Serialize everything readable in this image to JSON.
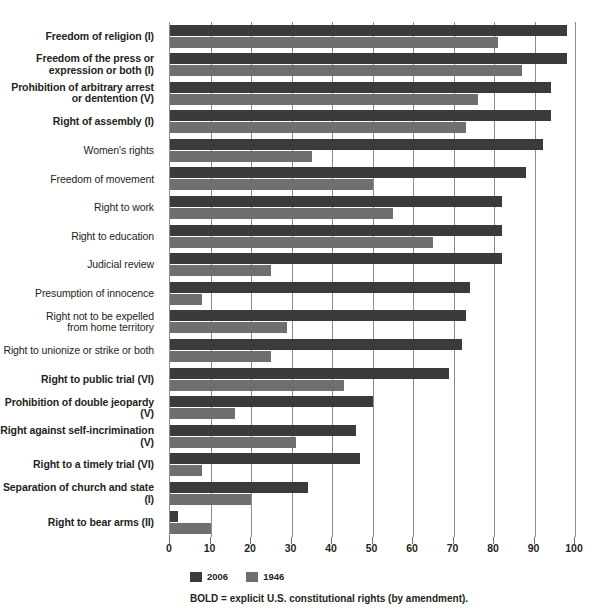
{
  "chart_data": {
    "type": "bar",
    "orientation": "horizontal",
    "title": "",
    "xlabel": "",
    "ylabel": "",
    "xlim": [
      0,
      100
    ],
    "xticks": [
      0,
      10,
      20,
      30,
      40,
      50,
      60,
      70,
      80,
      90,
      100
    ],
    "grid": true,
    "legend_position": "bottom-left",
    "categories": [
      "Freedom of religion (I)",
      "Freedom of the press or expression or both (I)",
      "Prohibition of arbitrary arrest or dentention (V)",
      "Right of assembly (I)",
      "Women's rights",
      "Freedom of movement",
      "Right to work",
      "Right to education",
      "Judicial review",
      "Presumption of innocence",
      "Right not to be expelled from home territory",
      "Right to unionize or strike or both",
      "Right to public trial (VI)",
      "Prohibition of double jeopardy (V)",
      "Right against self-incrimination (V)",
      "Right to a timely trial (VI)",
      "Separation of church and state (I)",
      "Right to bear arms (II)"
    ],
    "series": [
      {
        "name": "2006",
        "color": "#3b3b3b",
        "values": [
          98,
          98,
          94,
          94,
          92,
          88,
          82,
          82,
          82,
          74,
          73,
          72,
          69,
          50,
          46,
          47,
          34,
          2
        ]
      },
      {
        "name": "1946",
        "color": "#6f6f6f",
        "values": [
          81,
          87,
          76,
          73,
          35,
          50,
          55,
          65,
          25,
          8,
          29,
          25,
          43,
          16,
          31,
          8,
          20,
          10
        ]
      }
    ],
    "footnote": "BOLD = explicit U.S. constitutional rights (by amendment)."
  },
  "rows": [
    {
      "lines": [
        "Freedom of religion (I)"
      ],
      "bold": true,
      "v2006": 98,
      "v1946": 81
    },
    {
      "lines": [
        "Freedom of the press or",
        "expression or both (I)"
      ],
      "bold": true,
      "v2006": 98,
      "v1946": 87
    },
    {
      "lines": [
        "Prohibition of arbitrary arrest",
        "or dentention (V)"
      ],
      "bold": true,
      "v2006": 94,
      "v1946": 76
    },
    {
      "lines": [
        "Right of assembly (I)"
      ],
      "bold": true,
      "v2006": 94,
      "v1946": 73
    },
    {
      "lines": [
        "Women's rights"
      ],
      "bold": false,
      "v2006": 92,
      "v1946": 35
    },
    {
      "lines": [
        "Freedom of movement"
      ],
      "bold": false,
      "v2006": 88,
      "v1946": 50
    },
    {
      "lines": [
        "Right to work"
      ],
      "bold": false,
      "v2006": 82,
      "v1946": 55
    },
    {
      "lines": [
        "Right to education"
      ],
      "bold": false,
      "v2006": 82,
      "v1946": 65
    },
    {
      "lines": [
        "Judicial review"
      ],
      "bold": false,
      "v2006": 82,
      "v1946": 25
    },
    {
      "lines": [
        "Presumption of innocence"
      ],
      "bold": false,
      "v2006": 74,
      "v1946": 8
    },
    {
      "lines": [
        "Right not to be expelled",
        "from home territory"
      ],
      "bold": false,
      "v2006": 73,
      "v1946": 29
    },
    {
      "lines": [
        "Right to unionize or strike or both"
      ],
      "bold": false,
      "v2006": 72,
      "v1946": 25
    },
    {
      "lines": [
        "Right to public trial (VI)"
      ],
      "bold": true,
      "v2006": 69,
      "v1946": 43
    },
    {
      "lines": [
        "Prohibition of double jeopardy (V)"
      ],
      "bold": true,
      "v2006": 50,
      "v1946": 16
    },
    {
      "lines": [
        "Right against self-incrimination (V)"
      ],
      "bold": true,
      "v2006": 46,
      "v1946": 31
    },
    {
      "lines": [
        "Right to a timely trial (VI)"
      ],
      "bold": true,
      "v2006": 47,
      "v1946": 8
    },
    {
      "lines": [
        "Separation of church and state (I)"
      ],
      "bold": true,
      "v2006": 34,
      "v1946": 20
    },
    {
      "lines": [
        "Right to bear arms (II)"
      ],
      "bold": true,
      "v2006": 2,
      "v1946": 10
    }
  ],
  "axis": {
    "ticks": [
      "0",
      "10",
      "20",
      "30",
      "40",
      "50",
      "60",
      "70",
      "80",
      "90",
      "100"
    ],
    "min": 0,
    "max": 100
  },
  "legend": {
    "items": [
      {
        "label": "2006",
        "color": "#3b3b3b"
      },
      {
        "label": "1946",
        "color": "#6f6f6f"
      }
    ]
  },
  "footnote": {
    "text": "BOLD = explicit U.S. constitutional rights (by amendment)."
  }
}
